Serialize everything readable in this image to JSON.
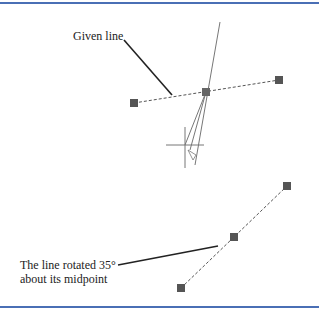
{
  "labels": {
    "given_line": "Given line",
    "rotated_line_1": "The line rotated 35°",
    "rotated_line_2": "about its midpoint"
  },
  "colors": {
    "border": "#4a6fb5",
    "grip": "#555555",
    "line": "#666666",
    "leader": "#222222"
  }
}
